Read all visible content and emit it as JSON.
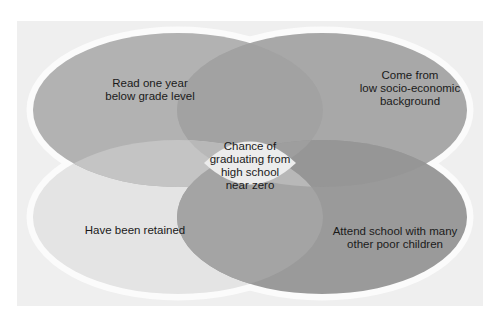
{
  "diagram": {
    "type": "venn",
    "sets": [
      {
        "id": "tl",
        "label": "Read one year below grade level",
        "lines": [
          "Read one year",
          "below grade level"
        ],
        "color": "#b0b0b0"
      },
      {
        "id": "tr",
        "label": "Come from low socio-economic background",
        "lines": [
          "Come from",
          "low socio-economic",
          "background"
        ],
        "color": "#a6a6a6"
      },
      {
        "id": "bl",
        "label": "Have been retained",
        "lines": [
          "Have been retained"
        ],
        "color": "#e6e6e6"
      },
      {
        "id": "br",
        "label": "Attend school with many other poor children",
        "lines": [
          "Attend school with many",
          "other poor children"
        ],
        "color": "#989898"
      }
    ],
    "center": {
      "label": "Chance of graduating from high school near zero",
      "lines": [
        "Chance of",
        "graduating from",
        "high school",
        "near zero"
      ],
      "color": "#ececec"
    }
  }
}
